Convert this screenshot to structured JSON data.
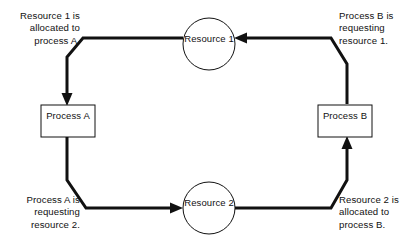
{
  "diagram": {
    "type": "resource-allocation-graph",
    "stroke_color": "#111111",
    "background_color": "#ffffff",
    "edge_width": 3,
    "node_border_width": 1,
    "nodes": [
      {
        "id": "resource-1",
        "shape": "circle",
        "line1": "Resource",
        "line2": "1",
        "cx": 209,
        "cy": 44,
        "r": 26
      },
      {
        "id": "resource-2",
        "shape": "circle",
        "line1": "Resource",
        "line2": "2",
        "cx": 209,
        "cy": 208,
        "r": 26
      },
      {
        "id": "process-a",
        "shape": "rect",
        "line1": "Process",
        "line2": "A",
        "x": 41,
        "y": 105,
        "w": 54,
        "h": 32
      },
      {
        "id": "process-b",
        "shape": "rect",
        "line1": "Process",
        "line2": "B",
        "x": 318,
        "y": 105,
        "w": 54,
        "h": 32
      }
    ],
    "annotations": [
      {
        "id": "annotation-resource1-allocated-process-a",
        "align": "right",
        "lines": [
          "Resource 1 is",
          "allocated to",
          "process A."
        ]
      },
      {
        "id": "annotation-process-b-requesting-resource1",
        "align": "left",
        "lines": [
          "Process B is",
          "requesting",
          "resource 1."
        ]
      },
      {
        "id": "annotation-process-a-requesting-resource2",
        "align": "right",
        "lines": [
          "Process A is",
          "requesting",
          "resource 2."
        ]
      },
      {
        "id": "annotation-resource2-allocated-process-b",
        "align": "left",
        "lines": [
          "Resource 2 is",
          "allocated to",
          "process B."
        ]
      }
    ],
    "edges": [
      {
        "id": "edge-resource1-to-process-a",
        "from": "resource-1",
        "to": "process-a",
        "arrow_at": "process-a"
      },
      {
        "id": "edge-process-b-to-resource1",
        "from": "process-b",
        "to": "resource-1",
        "arrow_at": "resource-1"
      },
      {
        "id": "edge-process-a-to-resource2",
        "from": "process-a",
        "to": "resource-2",
        "arrow_at": "resource-2"
      },
      {
        "id": "edge-resource2-to-process-b",
        "from": "resource-2",
        "to": "process-b",
        "arrow_at": "process-b"
      }
    ]
  }
}
